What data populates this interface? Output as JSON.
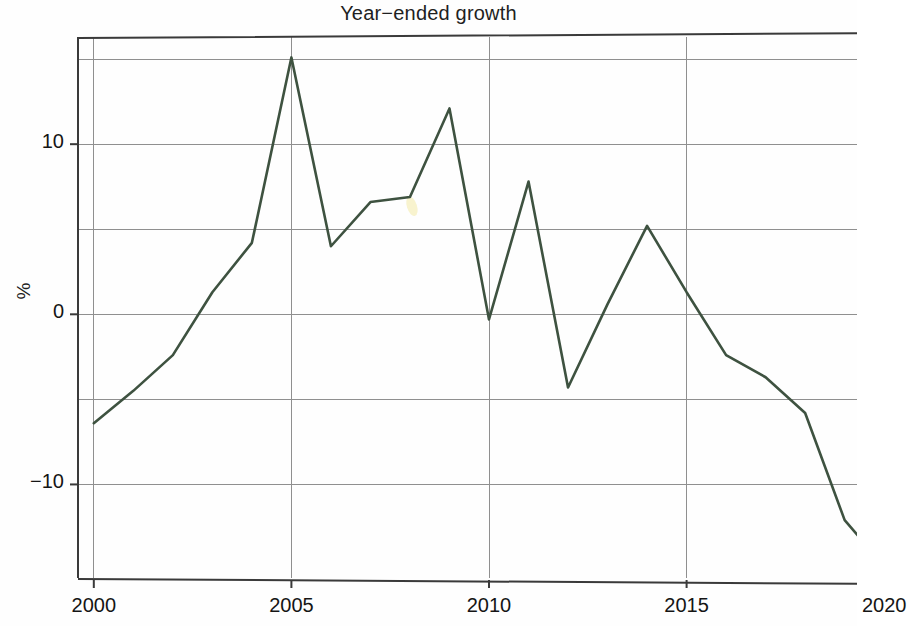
{
  "chart_data": {
    "type": "line",
    "title": "Year−ended growth",
    "xlabel": "",
    "ylabel": "%",
    "grid": true,
    "legend": "none",
    "xlim": [
      1999.6,
      2020.4
    ],
    "ylim": [
      -15.5,
      16.3
    ],
    "x_ticks": [
      "2000",
      "2005",
      "2010",
      "2015",
      "2020"
    ],
    "x_tick_values": [
      2000,
      2005,
      2010,
      2015,
      2020
    ],
    "y_ticks": [
      "10",
      "0",
      "−10"
    ],
    "y_tick_values": [
      10,
      0,
      -10
    ],
    "y_gridlines": [
      15,
      10,
      5,
      0,
      -5,
      -10
    ],
    "x_gridlines": [
      2000,
      2005,
      2010,
      2015,
      2020
    ],
    "line_color": "#3e5240",
    "x": [
      2000,
      2001,
      2002,
      2003,
      2004,
      2005,
      2006,
      2007,
      2008,
      2009,
      2010,
      2011,
      2012,
      2013,
      2014,
      2015,
      2016,
      2017,
      2018,
      2019,
      2020
    ],
    "values": [
      -6.4,
      -4.5,
      -2.4,
      1.3,
      4.2,
      15.1,
      4.0,
      6.6,
      6.9,
      12.1,
      -0.3,
      7.8,
      -4.3,
      0.6,
      5.2,
      1.3,
      -2.4,
      -3.7,
      -5.8,
      -12.1,
      -14.8
    ],
    "series": [
      {
        "name": "Year-ended growth",
        "color": "#3e5240",
        "values": [
          -6.4,
          -4.5,
          -2.4,
          1.3,
          4.2,
          15.1,
          4.0,
          6.6,
          6.9,
          12.1,
          -0.3,
          7.8,
          -4.3,
          0.6,
          5.2,
          1.3,
          -2.4,
          -3.7,
          -5.8,
          -12.1,
          -14.8
        ]
      }
    ],
    "annotations": [
      {
        "name": "yellow-highlighter-mark",
        "x": 2008.05,
        "y": 6.7,
        "color": "#f2eaa6"
      }
    ]
  }
}
